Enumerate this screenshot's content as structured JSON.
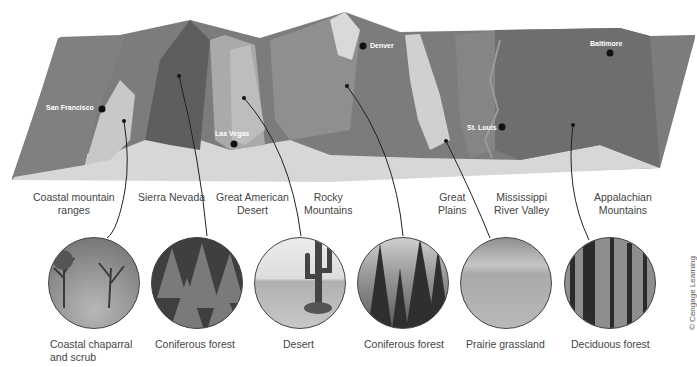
{
  "cities": [
    {
      "name": "San Francisco"
    },
    {
      "name": "Las Vegas"
    },
    {
      "name": "Denver"
    },
    {
      "name": "St. Louis"
    },
    {
      "name": "Baltimore"
    }
  ],
  "regions": [
    {
      "label": "Coastal mountain\nranges"
    },
    {
      "label": "Sierra Nevada"
    },
    {
      "label": "Great American\nDesert"
    },
    {
      "label": "Rocky\nMountains"
    },
    {
      "label": "Great\nPlains"
    },
    {
      "label": "Mississippi\nRiver Valley"
    },
    {
      "label": "Appalachian\nMountains"
    }
  ],
  "biomes": [
    {
      "caption": "Coastal chaparral\nand scrub",
      "icon": "chaparral-photo"
    },
    {
      "caption": "Coniferous forest",
      "icon": "conifer-photo"
    },
    {
      "caption": "Desert",
      "icon": "desert-photo"
    },
    {
      "caption": "Coniferous forest",
      "icon": "conifer-photo"
    },
    {
      "caption": "Prairie grassland",
      "icon": "grassland-photo"
    },
    {
      "caption": "Deciduous forest",
      "icon": "deciduous-photo"
    }
  ],
  "credit": "© Cengage Learning"
}
